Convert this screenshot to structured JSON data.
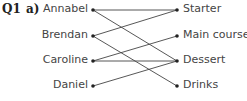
{
  "question": {
    "number": "Q1",
    "part": "a)"
  },
  "left_nodes": [
    "Annabel",
    "Brendan",
    "Caroline",
    "Daniel"
  ],
  "right_nodes": [
    "Starter",
    "Main course",
    "Dessert",
    "Drinks"
  ],
  "edges": [
    [
      "Annabel",
      "Starter"
    ],
    [
      "Annabel",
      "Dessert"
    ],
    [
      "Brendan",
      "Starter"
    ],
    [
      "Brendan",
      "Drinks"
    ],
    [
      "Caroline",
      "Main course"
    ],
    [
      "Caroline",
      "Dessert"
    ],
    [
      "Daniel",
      "Dessert"
    ]
  ]
}
